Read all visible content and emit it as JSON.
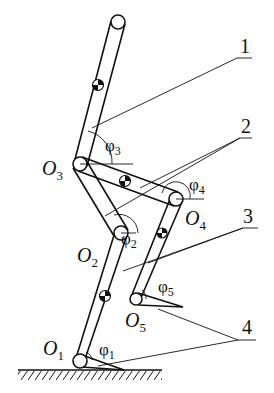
{
  "diagram": {
    "joints": [
      {
        "id": "O1",
        "label": "O",
        "sub": "1",
        "x": 80,
        "y": 361
      },
      {
        "id": "O2",
        "label": "O",
        "sub": "2",
        "x": 121,
        "y": 233
      },
      {
        "id": "O3",
        "label": "O",
        "sub": "3",
        "x": 80,
        "y": 164
      },
      {
        "id": "O4",
        "label": "O",
        "sub": "4",
        "x": 176,
        "y": 199
      },
      {
        "id": "O5",
        "label": "O",
        "sub": "5",
        "x": 136,
        "y": 299
      }
    ],
    "angles": [
      {
        "id": "phi1",
        "label": "φ",
        "sub": "1"
      },
      {
        "id": "phi2",
        "label": "φ",
        "sub": "2"
      },
      {
        "id": "phi3",
        "label": "φ",
        "sub": "3"
      },
      {
        "id": "phi4",
        "label": "φ",
        "sub": "4"
      },
      {
        "id": "phi5",
        "label": "φ",
        "sub": "5"
      }
    ],
    "callouts": [
      {
        "id": "c1",
        "label": "1"
      },
      {
        "id": "c2",
        "label": "2"
      },
      {
        "id": "c3",
        "label": "3"
      },
      {
        "id": "c4",
        "label": "4"
      }
    ],
    "colors": {
      "ink": "#111111",
      "background": "#ffffff"
    }
  }
}
